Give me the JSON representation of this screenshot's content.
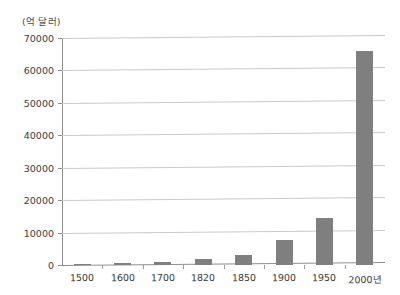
{
  "chart_data": {
    "type": "bar",
    "title": "",
    "subtitle": "",
    "xlabel": "",
    "ylabel": "(억 달러)",
    "y_unit_caption": "(억 달러)",
    "categories": [
      "1500",
      "1600",
      "1700",
      "1820",
      "1850",
      "1900",
      "1950",
      "2000년"
    ],
    "values": [
      250,
      600,
      1000,
      2000,
      3000,
      7800,
      14500,
      66000
    ],
    "series": [
      {
        "name": "",
        "values": [
          250,
          600,
          1000,
          2000,
          3000,
          7800,
          14500,
          66000
        ]
      }
    ],
    "ylim": [
      0,
      70000
    ],
    "y_ticks": [
      0,
      10000,
      20000,
      30000,
      40000,
      50000,
      60000,
      70000
    ],
    "y_tick_labels": [
      "0",
      "10000",
      "20000",
      "30000",
      "40000",
      "50000",
      "60000",
      "70000"
    ],
    "grid": true,
    "grid_axis": "y",
    "legend": false,
    "legend_position": "none",
    "bar_color": "#7f7f7f",
    "grid_color": "#c9c9c9",
    "axis_color": "#8f8f8f",
    "background_color": "#ffffff",
    "text_color": "#3a3a3a",
    "annotations": []
  }
}
